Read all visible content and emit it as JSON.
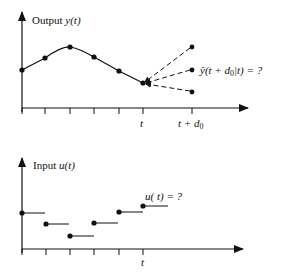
{
  "diagram": {
    "output_panel": {
      "title": "Output",
      "title_var": "y(t)",
      "x_labels": {
        "t": "t",
        "t_plus_d0": "t + d",
        "d_sub": "0"
      },
      "prediction_label": "ŷ(t + d",
      "prediction_sub": "0",
      "prediction_tail": "|t) = ?",
      "points": [
        [
          22,
          70
        ],
        [
          45,
          58
        ],
        [
          70,
          48
        ],
        [
          94,
          57
        ],
        [
          119,
          71
        ],
        [
          143,
          83
        ]
      ],
      "future_points": [
        [
          192,
          47
        ],
        [
          192,
          70
        ],
        [
          192,
          92
        ]
      ]
    },
    "input_panel": {
      "title": "Input",
      "title_var": "u(t)",
      "x_label": "t",
      "question_label": "u( t) = ?",
      "steps": [
        {
          "x": 22,
          "y": 213,
          "x2": 45
        },
        {
          "x": 46,
          "y": 224,
          "x2": 69
        },
        {
          "x": 70,
          "y": 236,
          "x2": 94
        },
        {
          "x": 94,
          "y": 223,
          "x2": 119
        },
        {
          "x": 119,
          "y": 212,
          "x2": 143
        },
        {
          "x": 143,
          "y": 206,
          "x2": 168
        }
      ]
    },
    "colors": {
      "ink": "#111111",
      "background": "#ffffff"
    }
  }
}
